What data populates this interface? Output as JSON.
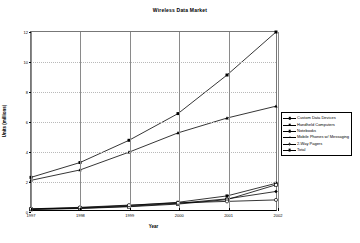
{
  "chart_data": {
    "type": "line",
    "title": "Wireless Data Market",
    "xlabel": "Year",
    "ylabel": "Units (millions)",
    "categories": [
      "1997",
      "1998",
      "1999",
      "2000",
      "2001",
      "2002"
    ],
    "x": [
      1997,
      1998,
      1999,
      2000,
      2001,
      2002
    ],
    "xlim": [
      1997,
      2002
    ],
    "ylim": [
      0,
      12
    ],
    "yticks": [
      "0",
      "2",
      "4",
      "6",
      "8",
      "10",
      "12"
    ],
    "ytick_values": [
      0,
      2,
      4,
      6,
      8,
      10,
      12
    ],
    "grid": "horizontal-dotted",
    "legend_position": "right",
    "series": [
      {
        "name": "Custom Data Devices",
        "marker": "diamond",
        "values": [
          0.05,
          0.12,
          0.25,
          0.45,
          0.75,
          1.25
        ]
      },
      {
        "name": "Handheld Computers",
        "marker": "square",
        "values": [
          0.06,
          0.15,
          0.3,
          0.52,
          0.95,
          1.8
        ]
      },
      {
        "name": "Notebooks",
        "marker": "square-open",
        "values": [
          0.04,
          0.1,
          0.22,
          0.4,
          0.7,
          1.7
        ]
      },
      {
        "name": "Mobile Phones w/ Messaging",
        "marker": "triangle",
        "values": [
          2.0,
          2.7,
          3.9,
          5.2,
          6.2,
          7.0
        ]
      },
      {
        "name": "2-Way Pagers",
        "marker": "circle",
        "values": [
          0.08,
          0.18,
          0.33,
          0.48,
          0.58,
          0.68
        ]
      },
      {
        "name": "Total",
        "marker": "star",
        "values": [
          2.2,
          3.2,
          4.7,
          6.5,
          9.1,
          12.0
        ]
      }
    ]
  },
  "legend": {
    "items": [
      {
        "label": "Custom Data Devices"
      },
      {
        "label": "Handheld Computers"
      },
      {
        "label": "Notebooks"
      },
      {
        "label": "Mobile Phones w/ Messaging"
      },
      {
        "label": "2-Way Pagers"
      },
      {
        "label": "Total"
      }
    ]
  },
  "colors": {
    "line": "#000000",
    "grid": "#b9b9b9",
    "axis": "#777777",
    "background": "#ffffff"
  }
}
